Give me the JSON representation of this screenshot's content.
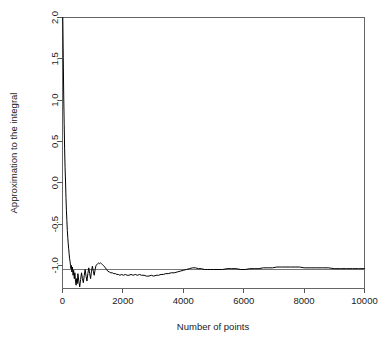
{
  "chart_data": {
    "type": "line",
    "title": "",
    "subtitle": "",
    "xlabel": "Number of points",
    "ylabel": "Approximation to the integral",
    "xlim": [
      0,
      10000
    ],
    "ylim": [
      -1.28,
      2.0
    ],
    "xticks": [
      0,
      2000,
      4000,
      6000,
      8000,
      10000
    ],
    "xtick_labels": [
      "0",
      "2000",
      "4000",
      "6000",
      "8000",
      "10000"
    ],
    "yticks": [
      2.0,
      1.5,
      1.0,
      0.5,
      0.0,
      -0.5,
      -1.0
    ],
    "ytick_labels": [
      "2.0",
      "1.5",
      "1.0",
      "0.5",
      "0.0",
      "-0.5",
      "-1.0"
    ],
    "grid": false,
    "legend": null,
    "legend_position": "none",
    "box": true,
    "series": [
      {
        "name": "Running Monte Carlo estimate",
        "color": "#000000",
        "x": [
          10,
          25,
          40,
          55,
          70,
          85,
          100,
          115,
          130,
          145,
          160,
          175,
          190,
          205,
          220,
          235,
          250,
          265,
          280,
          295,
          310,
          330,
          350,
          370,
          390,
          410,
          430,
          450,
          470,
          490,
          510,
          540,
          570,
          600,
          630,
          660,
          690,
          720,
          750,
          780,
          810,
          840,
          870,
          900,
          930,
          960,
          990,
          1020,
          1050,
          1080,
          1110,
          1140,
          1170,
          1200,
          1230,
          1260,
          1290,
          1320,
          1350,
          1380,
          1420,
          1460,
          1500,
          1550,
          1600,
          1650,
          1700,
          1750,
          1800,
          1850,
          1900,
          1960,
          2020,
          2080,
          2140,
          2200,
          2270,
          2340,
          2410,
          2480,
          2550,
          2620,
          2700,
          2780,
          2860,
          2940,
          3020,
          3100,
          3180,
          3260,
          3340,
          3420,
          3500,
          3600,
          3700,
          3800,
          3900,
          4000,
          4100,
          4200,
          4300,
          4400,
          4500,
          4600,
          4700,
          4800,
          4900,
          5000,
          5150,
          5300,
          5450,
          5600,
          5750,
          5900,
          6050,
          6200,
          6350,
          6500,
          6650,
          6800,
          6950,
          7100,
          7250,
          7400,
          7550,
          7700,
          7850,
          8000,
          8200,
          8400,
          8600,
          8800,
          9000,
          9200,
          9400,
          9600,
          9800,
          10000
        ],
        "y": [
          2.0,
          1.52,
          1.05,
          0.72,
          0.41,
          0.18,
          0.02,
          -0.18,
          -0.34,
          -0.46,
          -0.58,
          -0.66,
          -0.74,
          -0.8,
          -0.86,
          -0.92,
          -0.95,
          -1.0,
          -1.04,
          -1.0,
          -1.08,
          -1.02,
          -1.12,
          -1.06,
          -1.16,
          -1.09,
          -1.19,
          -1.24,
          -1.16,
          -1.22,
          -1.1,
          -1.19,
          -1.26,
          -1.17,
          -1.09,
          -1.16,
          -1.21,
          -1.12,
          -1.05,
          -1.13,
          -1.19,
          -1.1,
          -1.03,
          -1.1,
          -1.16,
          -1.07,
          -1.01,
          -1.07,
          -1.12,
          -1.05,
          -1.0,
          -0.99,
          -0.98,
          -0.97,
          -0.98,
          -0.97,
          -0.98,
          -0.99,
          -1.0,
          -1.01,
          -1.03,
          -1.05,
          -1.07,
          -1.08,
          -1.09,
          -1.09,
          -1.1,
          -1.1,
          -1.11,
          -1.11,
          -1.12,
          -1.11,
          -1.12,
          -1.11,
          -1.12,
          -1.12,
          -1.11,
          -1.12,
          -1.11,
          -1.12,
          -1.11,
          -1.12,
          -1.12,
          -1.13,
          -1.13,
          -1.12,
          -1.13,
          -1.12,
          -1.12,
          -1.11,
          -1.11,
          -1.1,
          -1.1,
          -1.09,
          -1.09,
          -1.08,
          -1.07,
          -1.06,
          -1.05,
          -1.04,
          -1.03,
          -1.03,
          -1.04,
          -1.04,
          -1.05,
          -1.05,
          -1.05,
          -1.05,
          -1.05,
          -1.05,
          -1.04,
          -1.04,
          -1.04,
          -1.05,
          -1.05,
          -1.04,
          -1.04,
          -1.04,
          -1.03,
          -1.03,
          -1.03,
          -1.02,
          -1.02,
          -1.02,
          -1.02,
          -1.02,
          -1.02,
          -1.03,
          -1.03,
          -1.03,
          -1.03,
          -1.03,
          -1.04,
          -1.04,
          -1.04,
          -1.04,
          -1.04,
          -1.04
        ]
      }
    ],
    "reference_line": {
      "name": "True value of the integral",
      "color": "#777777",
      "y": -1.055,
      "x_start": 0,
      "x_end": 10000
    },
    "annotations": []
  }
}
